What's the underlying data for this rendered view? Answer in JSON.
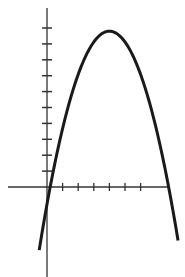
{
  "chart_data": {
    "type": "line",
    "title": "",
    "xlabel": "",
    "ylabel": "",
    "function": "y = -0.68*(x-4)^2 + 9.8",
    "vertex": [
      4,
      9.8
    ],
    "roots": [
      0.2,
      7.8
    ],
    "x_ticks": [
      1,
      2,
      3,
      4,
      5,
      6
    ],
    "y_ticks": [
      1,
      2,
      3,
      4,
      5,
      6,
      7,
      8,
      9,
      10
    ],
    "xlim": [
      -2.5,
      7.7
    ],
    "ylim": [
      -5.6,
      11.2
    ],
    "series": [
      {
        "name": "parabola",
        "x": [
          -0.5,
          0,
          0.2,
          1,
          2,
          3,
          4,
          5,
          6,
          7,
          7.8,
          8.4
        ],
        "y": [
          -3.97,
          -1.08,
          0,
          3.68,
          7.08,
          9.12,
          9.8,
          9.12,
          7.08,
          3.68,
          0,
          -3.4
        ]
      }
    ],
    "grid": false,
    "legend": null,
    "colors": {
      "line": "#1a1a1a",
      "axes": "#333333",
      "background": "#ffffff"
    }
  }
}
